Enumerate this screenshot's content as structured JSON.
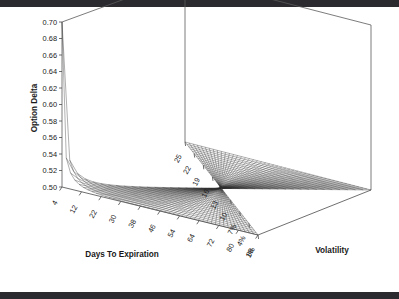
{
  "figure": {
    "kind": "3d-surface-wireframe",
    "background_color": "#ffffff",
    "line_color": "#2e2e2e",
    "frame_color": "#5a5a5a",
    "top_bar_color": "#2b2b2f",
    "bottom_bar_color": "#2b2b2f"
  },
  "chart_data": {
    "type": "surface",
    "title": "",
    "subtitle": "",
    "xlabel": "Days To Expiration",
    "ylabel": "Volatility",
    "zlabel": "Option Delta",
    "grid": false,
    "legend": "none",
    "projection": "3d-wireframe-mesh",
    "zlim": [
      0.5,
      0.7
    ],
    "z_ticks": [
      "0.70",
      "0.68",
      "0.66",
      "0.64",
      "0.62",
      "0.60",
      "0.58",
      "0.56",
      "0.54",
      "0.52",
      "0.50"
    ],
    "z_tick_values": [
      0.7,
      0.68,
      0.66,
      0.64,
      0.62,
      0.6,
      0.58,
      0.56,
      0.54,
      0.52,
      0.5
    ],
    "x_ticks": [
      "4",
      "12",
      "22",
      "30",
      "38",
      "46",
      "54",
      "64",
      "72",
      "80",
      "88"
    ],
    "x_tick_values": [
      4,
      12,
      22,
      30,
      38,
      46,
      54,
      64,
      72,
      80,
      88
    ],
    "y_ticks": [
      "25",
      "22",
      "19",
      "16",
      "13",
      "10",
      "7%",
      "4%",
      "1%"
    ],
    "y_tick_values": [
      25,
      22,
      19,
      16,
      13,
      10,
      7,
      4,
      1
    ],
    "peak": {
      "x": 4,
      "y": 1,
      "z": 0.7
    },
    "floor_value": 0.5,
    "surface_samples": {
      "x_grid": [
        4,
        12,
        22,
        30,
        38,
        46,
        54,
        64,
        72,
        80,
        88
      ],
      "y_grid": [
        1,
        4,
        7,
        10,
        13,
        16,
        19,
        22,
        25
      ],
      "z_rows": [
        [
          0.7,
          0.592,
          0.556,
          0.542,
          0.534,
          0.529,
          0.526,
          0.523,
          0.521
        ],
        [
          0.616,
          0.552,
          0.534,
          0.526,
          0.521,
          0.518,
          0.516,
          0.514,
          0.513
        ],
        [
          0.57,
          0.536,
          0.525,
          0.519,
          0.516,
          0.513,
          0.512,
          0.511,
          0.51
        ],
        [
          0.556,
          0.53,
          0.521,
          0.516,
          0.513,
          0.511,
          0.51,
          0.509,
          0.508
        ],
        [
          0.547,
          0.526,
          0.518,
          0.514,
          0.511,
          0.51,
          0.509,
          0.508,
          0.507
        ],
        [
          0.541,
          0.523,
          0.516,
          0.512,
          0.51,
          0.509,
          0.508,
          0.507,
          0.506
        ],
        [
          0.537,
          0.521,
          0.515,
          0.511,
          0.509,
          0.508,
          0.507,
          0.506,
          0.506
        ],
        [
          0.532,
          0.519,
          0.513,
          0.51,
          0.508,
          0.507,
          0.506,
          0.505,
          0.505
        ],
        [
          0.529,
          0.517,
          0.512,
          0.509,
          0.507,
          0.506,
          0.505,
          0.505,
          0.504
        ],
        [
          0.526,
          0.516,
          0.511,
          0.508,
          0.507,
          0.506,
          0.505,
          0.504,
          0.504
        ],
        [
          0.524,
          0.515,
          0.51,
          0.508,
          0.506,
          0.505,
          0.504,
          0.504,
          0.503
        ]
      ]
    }
  },
  "axes": {
    "z_title": "Option Delta",
    "x_title": "Days To Expiration",
    "y_title": "Volatility"
  }
}
